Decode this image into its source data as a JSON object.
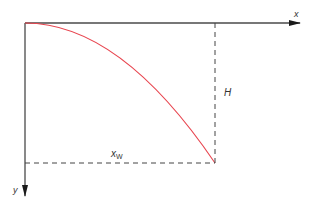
{
  "diagram": {
    "type": "projectile-trajectory",
    "axes": {
      "x_label": "x",
      "y_label": "y"
    },
    "labels": {
      "height": "H",
      "range_main": "x",
      "range_sub": "W"
    },
    "colors": {
      "axis": "#4a4a4a",
      "curve": "#e8454f",
      "dashed": "#444444",
      "text": "#333333"
    }
  }
}
